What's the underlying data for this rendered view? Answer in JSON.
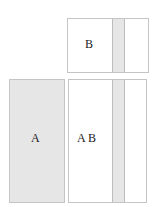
{
  "diagram": {
    "boxes": [
      {
        "id": "B",
        "label": "B",
        "fill": "#ffffff",
        "has_band": true
      },
      {
        "id": "A",
        "label": "A",
        "fill": "#e6e6e6",
        "has_band": false
      },
      {
        "id": "AB",
        "label": "A B",
        "fill": "#ffffff",
        "has_band": true
      }
    ],
    "band_fill": "#e6e6e6",
    "border_color": "#c4c4c4"
  }
}
